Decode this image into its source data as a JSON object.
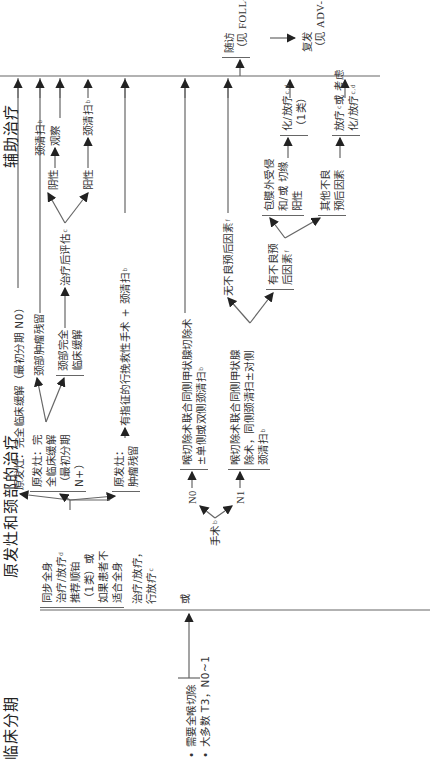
{
  "headers": {
    "clinical_stage": "临床分期",
    "primary_neck_treatment": "原发灶和颈部的治疗",
    "adjuvant_treatment": "辅助治疗"
  },
  "clinical_stage": {
    "bullet_1": "• 需要全喉切除",
    "bullet_2": "• 大多数 T3，N0~1"
  },
  "primary_options": {
    "option_chemo": {
      "lines": [
        "同步全身",
        "治疗/放疗",
        "推荐顺铂",
        "（1类）或",
        "如果患者不",
        "适合全身"
      ],
      "sup": "d"
    },
    "option_rt": {
      "lines": [
        "治疗/放疗，",
        "行放疗"
      ],
      "sup": "c"
    },
    "or_label": "或",
    "surgery_label": "手术",
    "surgery_sup": "b"
  },
  "chemo_outcomes": {
    "complete_response": "原发灶：完全临床缓解（最初分期 N0）",
    "primary_cr_n_plus": [
      "原发灶：完",
      "全临床缓解",
      "（最初分期",
      "N+）"
    ],
    "neck_residual": "颈部肿瘤残留",
    "neck_cr": [
      "颈部完全",
      "临床缓解"
    ],
    "post_eval": "治疗后评估",
    "post_eval_sup": "c",
    "negative": "阴性",
    "positive": "阳性",
    "observe": "观察",
    "neck_dissection_1": "颈清扫",
    "neck_dissection_2": "颈清扫",
    "neck_dissection_3": "颈清扫",
    "nd_sup": "b",
    "primary_residual": [
      "原发灶：",
      "肿瘤残留"
    ],
    "salvage": "有指征的行挽救性手术 + 颈清扫",
    "salvage_sup": "b"
  },
  "surgery_paths": {
    "n0_label": "N0",
    "n1_label": "N1",
    "n0_box": [
      "喉切除术联合同侧甲状腺切除术",
      "±单侧或双侧颈清扫"
    ],
    "n0_sup": "b",
    "n1_box": [
      "喉切除术联合同侧甲状腺",
      "除术，同侧颈清扫±对侧",
      "颈清扫"
    ],
    "n1_sup": "b",
    "no_adverse": "无不良预后因素",
    "no_adverse_sup": "f",
    "adverse": [
      "有不良预",
      "后因素"
    ],
    "adverse_sup": "f",
    "ece": [
      "包膜外受侵",
      "和/或 切缘",
      "阳性"
    ],
    "other_adverse": [
      "其他不良",
      "预后因素"
    ],
    "chemo_rt_1": [
      "化/放疗",
      "（1类）"
    ],
    "chemo_rt_1_sup": "c,d",
    "rt_or": "放疗",
    "rt_or_sup": "c",
    "rt_or_tail": "或 考虑",
    "chemo_rt_2": "化/放疗",
    "chemo_rt_2_sup": "c,d"
  },
  "followup": {
    "follow": "随访",
    "follow_ref": "（见 FOLL-A）",
    "recurrence": "复发",
    "recurrence_ref": "（见 ADV-2）"
  },
  "colors": {
    "line": "#666666",
    "text": "#333333",
    "background": "#ffffff"
  }
}
